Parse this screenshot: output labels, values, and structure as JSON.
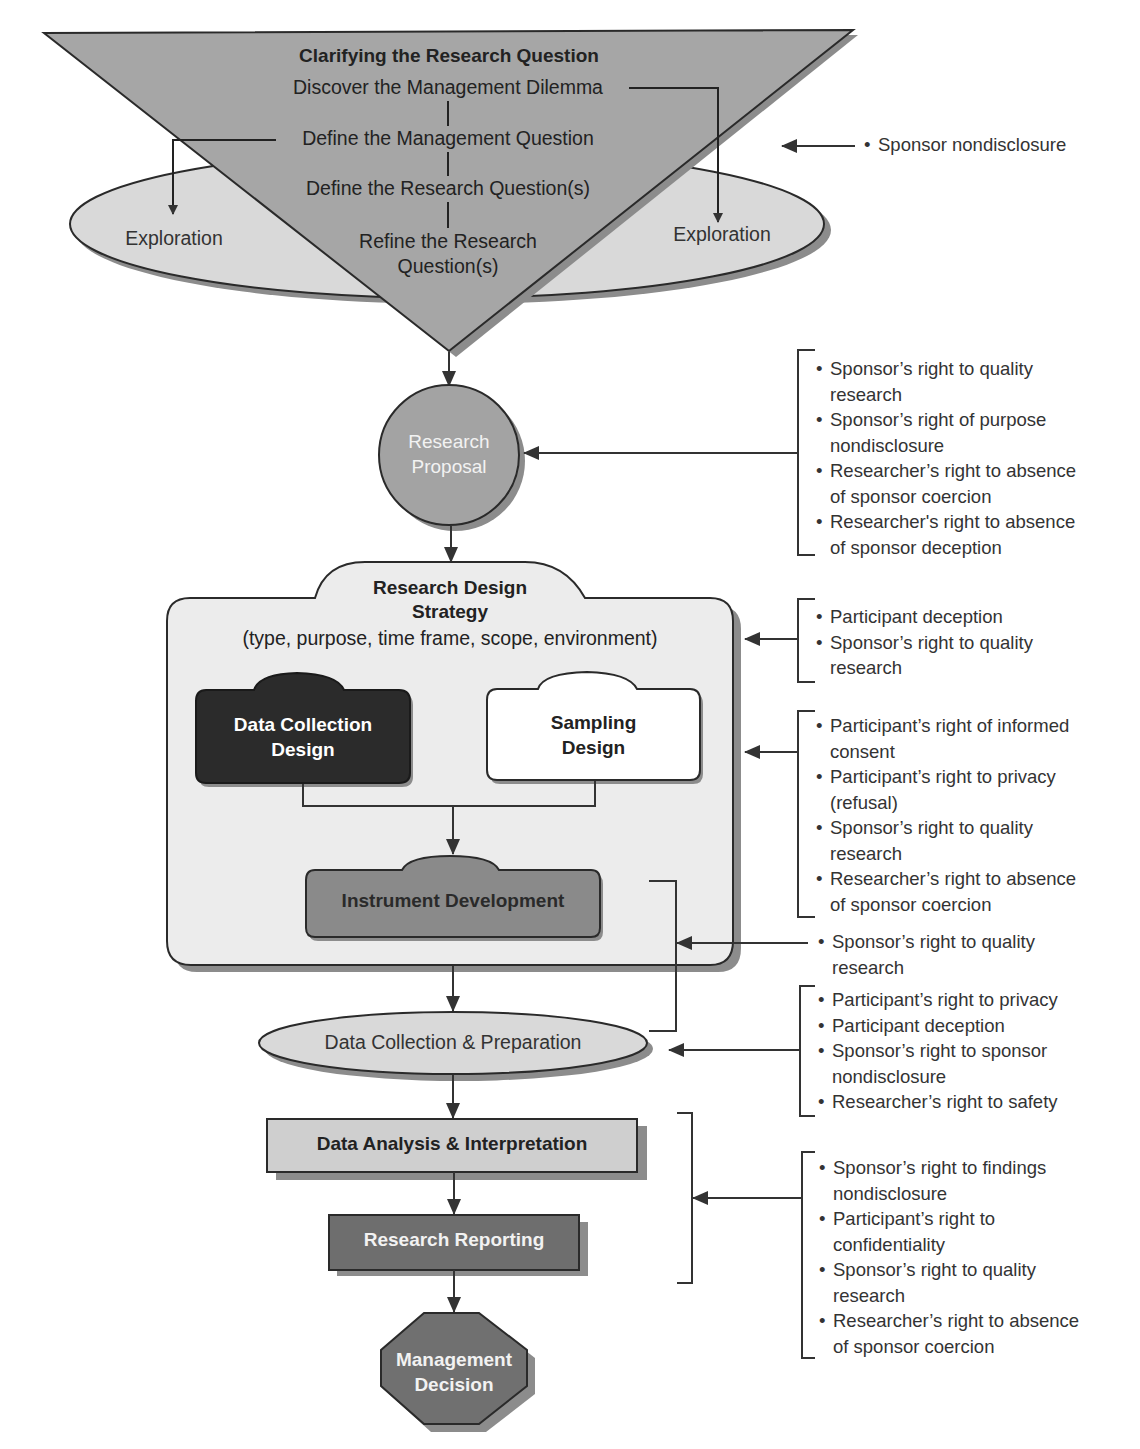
{
  "funnel": {
    "title": "Clarifying the Research Question",
    "steps": [
      "Discover the Management Dilemma",
      "Define the Management Question",
      "Define the Research Question(s)",
      "Refine the Research\nQuestion(s)"
    ],
    "exploration_left": "Exploration",
    "exploration_right": "Exploration"
  },
  "nodes": {
    "research_proposal": "Research\nProposal",
    "design_strategy_title": "Research Design\nStrategy",
    "design_strategy_subtitle": "(type, purpose, time frame, scope, environment)",
    "data_collection_design": "Data Collection\nDesign",
    "sampling_design": "Sampling\nDesign",
    "instrument_development": "Instrument Development",
    "data_collection_preparation": "Data Collection & Preparation",
    "data_analysis": "Data Analysis & Interpretation",
    "research_reporting": "Research Reporting",
    "management_decision": "Management\nDecision"
  },
  "ethics_groups": [
    {
      "target": "Clarifying the Research Question",
      "items": [
        "Sponsor nondisclosure"
      ]
    },
    {
      "target": "Research Proposal",
      "items": [
        "Sponsor’s right to quality\nresearch",
        "Sponsor’s right of purpose\nnondisclosure",
        "Researcher’s right to absence\nof sponsor coercion",
        "Researcher's right to absence\nof sponsor deception"
      ]
    },
    {
      "target": "Research Design Strategy",
      "items": [
        "Participant deception",
        "Sponsor’s right to quality\nresearch"
      ]
    },
    {
      "target": "Sampling Design",
      "items": [
        "Participant’s right of informed\nconsent",
        "Participant’s right to privacy\n(refusal)",
        "Sponsor’s right to quality\nresearch",
        "Researcher’s right to absence\nof sponsor coercion"
      ]
    },
    {
      "target": "Instrument Development / Data Collection",
      "items": [
        "Sponsor’s right to quality\nresearch"
      ]
    },
    {
      "target": "Data Collection & Preparation",
      "items": [
        "Participant’s right to privacy",
        "Participant deception",
        "Sponsor’s right to sponsor\nnondisclosure",
        "Researcher’s right to safety"
      ]
    },
    {
      "target": "Data Analysis & Reporting",
      "items": [
        "Sponsor’s right to findings\nnondisclosure",
        "Participant’s right to\nconfidentiality",
        "Sponsor’s right to quality\nresearch",
        "Researcher’s right to absence\nof sponsor coercion"
      ]
    }
  ],
  "colors": {
    "funnel_fill": "#a6a6a6",
    "ellipse_fill": "#d9d9d9",
    "proposal_fill": "#a3a3a3",
    "strategy_fill": "#ececec",
    "dark_box": "#2b2b2b",
    "instrument_fill": "#8a8a8a",
    "analysis_fill": "#cfcfcf",
    "reporting_fill": "#6e6e6e",
    "decision_fill": "#707070",
    "shadow": "#8c8c8c",
    "stroke": "#2a2a2a"
  }
}
